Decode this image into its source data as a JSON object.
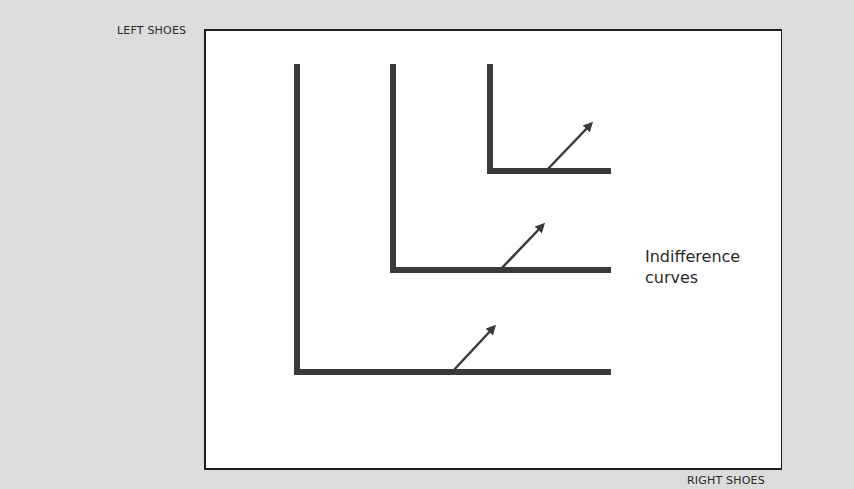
{
  "diagram": {
    "title": "",
    "y_axis_label": "LEFT SHOES",
    "x_axis_label": "RIGHT SHOES",
    "annotation_line1": "Indifference",
    "annotation_line2": "curves",
    "line_color": "#3a3a3a",
    "curves": [
      {
        "name": "indifference-curve-1",
        "corner_x": 297,
        "top_y": 64,
        "corner_y": 372,
        "end_x": 611,
        "arrow_from": [
          452,
          372
        ],
        "arrow_to": [
          494,
          327
        ]
      },
      {
        "name": "indifference-curve-2",
        "corner_x": 393,
        "top_y": 64,
        "corner_y": 270,
        "end_x": 611,
        "arrow_from": [
          500,
          270
        ],
        "arrow_to": [
          543,
          225
        ]
      },
      {
        "name": "indifference-curve-3",
        "corner_x": 490,
        "top_y": 64,
        "corner_y": 171,
        "end_x": 611,
        "arrow_from": [
          546,
          171
        ],
        "arrow_to": [
          591,
          124
        ]
      }
    ]
  }
}
